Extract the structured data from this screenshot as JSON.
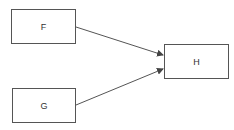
{
  "diagram": {
    "nodes": [
      {
        "id": "F",
        "label": "F",
        "x": 11,
        "y": 9,
        "w": 65,
        "h": 35
      },
      {
        "id": "G",
        "label": "G",
        "x": 12,
        "y": 88,
        "w": 64,
        "h": 35
      },
      {
        "id": "H",
        "label": "H",
        "x": 164,
        "y": 44,
        "w": 65,
        "h": 35
      }
    ],
    "edges": [
      {
        "from": "F",
        "to": "H"
      },
      {
        "from": "G",
        "to": "H"
      }
    ],
    "colors": {
      "stroke": "#555555",
      "text": "#333333",
      "background": "#ffffff"
    }
  }
}
